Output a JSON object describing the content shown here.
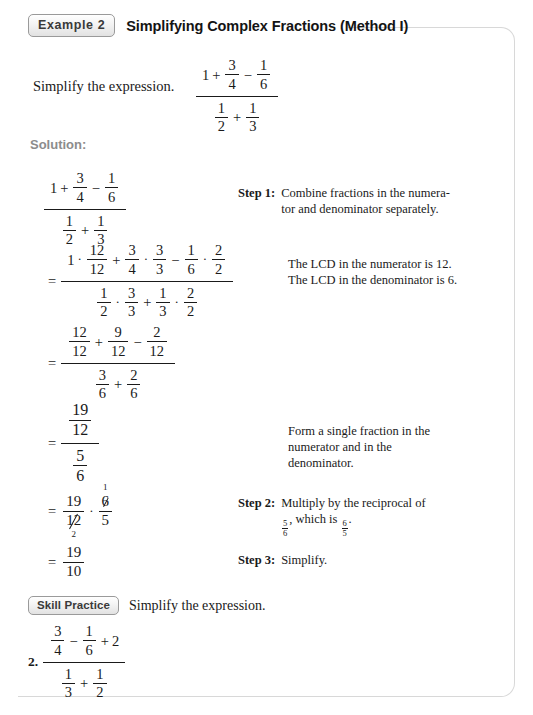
{
  "header": {
    "badge": "Example 2",
    "title": "Simplifying Complex Fractions (Method I)"
  },
  "prompt": {
    "text": "Simplify the expression."
  },
  "solution_label": "Solution:",
  "symbols": {
    "equals": "=",
    "plus": "+",
    "minus": "−",
    "dot": "·"
  },
  "main_expression": {
    "numerator": {
      "whole": "1",
      "op1": "+",
      "frac1": {
        "num": "3",
        "den": "4"
      },
      "op2": "−",
      "frac2": {
        "num": "1",
        "den": "6"
      }
    },
    "denominator": {
      "frac1": {
        "num": "1",
        "den": "2"
      },
      "op": "+",
      "frac2": {
        "num": "1",
        "den": "3"
      }
    }
  },
  "steps": [
    {
      "line_id": "line-1",
      "numerator": {
        "whole": "1",
        "op1": "+",
        "frac1": {
          "num": "3",
          "den": "4"
        },
        "op2": "−",
        "frac2": {
          "num": "1",
          "den": "6"
        }
      },
      "denominator": {
        "frac1": {
          "num": "1",
          "den": "2"
        },
        "op": "+",
        "frac2": {
          "num": "1",
          "den": "3"
        }
      }
    },
    {
      "line_id": "line-2",
      "numerator": {
        "t1_whole": "1",
        "t1_frac": {
          "num": "12",
          "den": "12"
        },
        "op1": "+",
        "t2_frac_a": {
          "num": "3",
          "den": "4"
        },
        "t2_frac_b": {
          "num": "3",
          "den": "3"
        },
        "op2": "−",
        "t3_frac_a": {
          "num": "1",
          "den": "6"
        },
        "t3_frac_b": {
          "num": "2",
          "den": "2"
        }
      },
      "denominator": {
        "t1_frac_a": {
          "num": "1",
          "den": "2"
        },
        "t1_frac_b": {
          "num": "3",
          "den": "3"
        },
        "op": "+",
        "t2_frac_a": {
          "num": "1",
          "den": "3"
        },
        "t2_frac_b": {
          "num": "2",
          "den": "2"
        }
      }
    },
    {
      "line_id": "line-3",
      "numerator": {
        "frac1": {
          "num": "12",
          "den": "12"
        },
        "op1": "+",
        "frac2": {
          "num": "9",
          "den": "12"
        },
        "op2": "−",
        "frac3": {
          "num": "2",
          "den": "12"
        }
      },
      "denominator": {
        "frac1": {
          "num": "3",
          "den": "6"
        },
        "op": "+",
        "frac2": {
          "num": "2",
          "den": "6"
        }
      }
    },
    {
      "line_id": "line-4",
      "numerator": {
        "num": "19",
        "den": "12"
      },
      "denominator": {
        "num": "5",
        "den": "6"
      }
    },
    {
      "line_id": "line-5",
      "left_frac": {
        "num": "19",
        "den": "12",
        "den_cancel_value": "2"
      },
      "right_frac": {
        "num": "6",
        "num_cancel_value": "1",
        "den": "5"
      }
    },
    {
      "line_id": "line-6",
      "result": {
        "num": "19",
        "den": "10"
      }
    }
  ],
  "annotations": {
    "step1": {
      "label": "Step 1:",
      "line1": "Combine fractions in the numera-",
      "line2": "tor and denominator separately."
    },
    "lcd": {
      "line1": "The LCD in the numerator is 12.",
      "line2": "The LCD in the denominator is 6."
    },
    "single_fraction": {
      "line1": "Form a single fraction in the",
      "line2": "numerator and in the",
      "line3": "denominator."
    },
    "step2": {
      "label": "Step 2:",
      "line1": "Multiply by the reciprocal of",
      "line2_prefix": "",
      "frac_a": {
        "num": "5",
        "den": "6"
      },
      "line2_mid": ", which is ",
      "frac_b": {
        "num": "6",
        "den": "5"
      },
      "line2_suffix": "."
    },
    "step3": {
      "label": "Step 3:",
      "text": "Simplify."
    }
  },
  "skill_practice": {
    "badge": "Skill Practice",
    "instruction": "Simplify the expression.",
    "problem_number": "2.",
    "problem": {
      "numerator": {
        "frac1": {
          "num": "3",
          "den": "4"
        },
        "op1": "−",
        "frac2": {
          "num": "1",
          "den": "6"
        },
        "op2": "+",
        "whole": "2"
      },
      "denominator": {
        "frac1": {
          "num": "1",
          "den": "3"
        },
        "op": "+",
        "frac2": {
          "num": "1",
          "den": "2"
        }
      }
    }
  },
  "colors": {
    "border": "#d8d8d8",
    "badge_text": "#3a3a3a",
    "solution_label": "#8c8c8c",
    "text": "#1a1a1a"
  }
}
